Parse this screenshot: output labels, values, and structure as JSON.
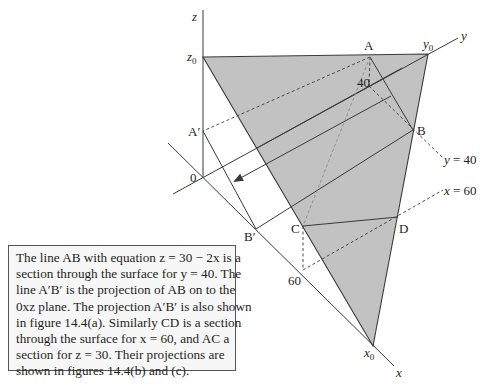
{
  "figure": {
    "axis_labels": {
      "z": "z",
      "y": "y",
      "x": "x"
    },
    "intercepts": {
      "z0": "z",
      "z0_sub": "0",
      "y0": "y",
      "y0_sub": "0",
      "x0": "x",
      "x0_sub": "0"
    },
    "origin_label": "0",
    "points": {
      "A": "A",
      "B": "B",
      "C": "C",
      "D": "D",
      "A_prime": "A′",
      "B_prime": "B′"
    },
    "ticks": {
      "y40": "40",
      "x60": "60"
    },
    "section_labels": {
      "y_eq_40": "y = 40",
      "x_eq_60": "x = 60"
    },
    "colors": {
      "surface_fill": "#c2c2c2",
      "line": "#3a3a3a",
      "dashed_light": "#8a8a8a"
    }
  },
  "caption": {
    "lines": [
      "The line AB with equation z = 30 − 2x is a",
      "section through the surface for y = 40. The",
      "line A′B′ is the projection of AB on to the",
      "0xz plane. The projection A′B′ is also shown",
      "in figure 14.4(a). Similarly CD is a section",
      "through the surface for x = 60, and AC a",
      "section for z = 30. Their projections are",
      "shown in figures 14.4(b) and (c)."
    ]
  }
}
